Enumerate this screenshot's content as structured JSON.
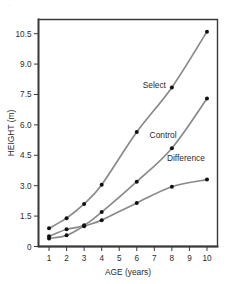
{
  "corner_mark": "·",
  "chart_data": {
    "type": "line",
    "title": "",
    "subtitle": "",
    "xlabel": "AGE (years)",
    "ylabel": "HEIGHT (m)",
    "x": [
      1,
      2,
      3,
      4,
      6,
      8,
      10
    ],
    "xlim": [
      0.4,
      10.6
    ],
    "ylim": [
      0,
      11.2
    ],
    "xticks": [
      1,
      2,
      3,
      4,
      5,
      6,
      7,
      8,
      9,
      10
    ],
    "xtick_labels": [
      "1",
      "2",
      "3",
      "4",
      "5",
      "6",
      "7",
      "8",
      "9",
      "10"
    ],
    "yticks": [
      0,
      1.5,
      3.0,
      4.5,
      6.0,
      7.5,
      9.0,
      10.5
    ],
    "ytick_labels": [
      "0",
      "1.5",
      "3.0",
      "4.5",
      "6.0",
      "7.5",
      "9.0",
      "10.5"
    ],
    "grid": false,
    "legend_position": "inline-annotations",
    "marker": "filled-circle",
    "line_color": "#8a8a8a",
    "marker_color": "#111111",
    "axis_color": "#3a3a3a",
    "series": [
      {
        "name": "Select",
        "values": [
          0.9,
          1.4,
          2.1,
          3.05,
          5.65,
          7.85,
          10.6
        ],
        "label_x": 7.0,
        "label_y": 7.8
      },
      {
        "name": "Control",
        "values": [
          0.5,
          0.85,
          1.05,
          1.7,
          3.2,
          4.85,
          7.3
        ],
        "label_x": 7.5,
        "label_y": 5.35
      },
      {
        "name": "Difference",
        "values": [
          0.4,
          0.55,
          1.0,
          1.3,
          2.15,
          2.95,
          3.3
        ],
        "label_x": 8.8,
        "label_y": 4.2
      }
    ]
  }
}
